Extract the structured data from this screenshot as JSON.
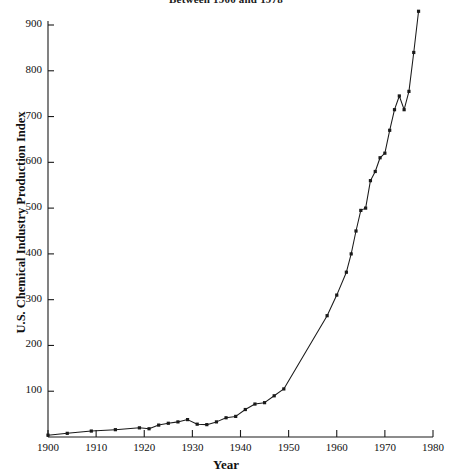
{
  "caption": "Between 1900 and 1978",
  "chart_data": {
    "type": "line",
    "title": "Between 1900 and 1978",
    "xlabel": "Year",
    "ylabel": "U.S. Chemical Industry Production Index",
    "xlim": [
      1900,
      1980
    ],
    "ylim": [
      0,
      940
    ],
    "grid": false,
    "legend": "none",
    "marker": "filled-square",
    "line_color": "#1a1a1a",
    "xticks": [
      1900,
      1910,
      1920,
      1930,
      1940,
      1950,
      1960,
      1970,
      1980
    ],
    "xticklabels": [
      "1900",
      "1910",
      "1920",
      "1930",
      "1940",
      "1950",
      "1960",
      "1970",
      "1980"
    ],
    "yticks": [
      100,
      200,
      300,
      400,
      500,
      600,
      700,
      800,
      900
    ],
    "yticklabels": [
      "100",
      "200",
      "300",
      "400",
      "500",
      "600",
      "700",
      "800",
      "900"
    ],
    "x": [
      1900,
      1904,
      1909,
      1914,
      1919,
      1921,
      1923,
      1925,
      1927,
      1929,
      1931,
      1933,
      1935,
      1937,
      1939,
      1941,
      1943,
      1945,
      1947,
      1949,
      1958,
      1960,
      1962,
      1963,
      1964,
      1965,
      1966,
      1967,
      1968,
      1969,
      1970,
      1971,
      1972,
      1973,
      1974,
      1975,
      1976,
      1977
    ],
    "values": [
      4,
      8,
      13,
      16,
      20,
      18,
      26,
      30,
      33,
      38,
      28,
      27,
      33,
      42,
      45,
      60,
      72,
      75,
      90,
      105,
      265,
      310,
      360,
      400,
      450,
      495,
      500,
      560,
      580,
      610,
      620,
      670,
      715,
      745,
      715,
      755,
      840,
      930
    ],
    "series": [
      {
        "name": "U.S. Chemical Industry Production Index",
        "values": [
          4,
          8,
          13,
          16,
          20,
          18,
          26,
          30,
          33,
          38,
          28,
          27,
          33,
          42,
          45,
          60,
          72,
          75,
          90,
          105,
          265,
          310,
          360,
          400,
          450,
          495,
          500,
          560,
          580,
          610,
          620,
          670,
          715,
          745,
          715,
          755,
          840,
          930
        ]
      }
    ],
    "annotations": [
      "Sharp acceleration after 1949",
      "Local peak near 1929 followed by depression dip near 1932",
      "Dip near 1974 before resuming rise"
    ]
  }
}
